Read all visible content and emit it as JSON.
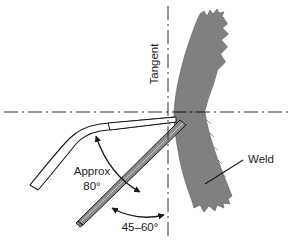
{
  "diagram": {
    "background_color": "#ffffff",
    "line_color": "#1a1a1a",
    "weld_fill_color": "#808080",
    "electrode_fill_color": "#8a8a8a",
    "filler_rod_fill_color": "#ffffff",
    "centerline_style": "dash-dot"
  },
  "labels": {
    "tangent": "Tangent",
    "approx": "Approx",
    "approx_angle": "80°",
    "work_angle": "45–60°",
    "weld": "Weld"
  },
  "annotations": {
    "tangent_line": {
      "name": "tangent",
      "orientation": "vertical",
      "rotation_deg": -90,
      "x": 168
    },
    "horizontal_centerline": {
      "name": "horizontal-centerline",
      "orientation": "horizontal",
      "y": 112
    },
    "angle_dimensions": [
      {
        "label": "Approx 80°",
        "value": 80,
        "unit": "degrees",
        "between": "filler-rod and electrode",
        "qualifier": "approx"
      },
      {
        "label": "45–60°",
        "value_min": 45,
        "value_max": 60,
        "unit": "degrees",
        "between": "electrode and tangent",
        "qualifier": "range"
      }
    ],
    "leader_lines": [
      {
        "label": "Weld",
        "target": "weld-bead"
      }
    ]
  },
  "parts": [
    {
      "name": "weld-bead-upper",
      "fill": "#808080",
      "description": "curved weld bead above joint with jagged edge"
    },
    {
      "name": "weld-bead-lower",
      "fill": "#808080",
      "description": "weld bead below joint angled down-right"
    },
    {
      "name": "filler-rod",
      "fill": "#ffffff",
      "description": "bent white tapered filler rod entering from lower left"
    },
    {
      "name": "electrode",
      "fill": "#8a8a8a",
      "description": "gray welding electrode angled up-right"
    }
  ]
}
